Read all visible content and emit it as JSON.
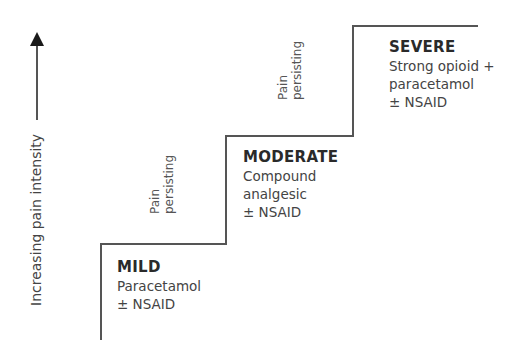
{
  "axis": {
    "label": "Increasing pain intensity",
    "arrow": "arrow-up"
  },
  "steps": [
    {
      "title": "MILD",
      "lines": [
        "Paracetamol",
        "± NSAID"
      ]
    },
    {
      "title": "MODERATE",
      "lines": [
        "Compound",
        "analgesic",
        "± NSAID"
      ]
    },
    {
      "title": "SEVERE",
      "lines": [
        "Strong opioid +",
        "paracetamol",
        "± NSAID"
      ]
    }
  ],
  "transitions": [
    {
      "line1": "Pain",
      "line2": "persisting"
    },
    {
      "line1": "Pain",
      "line2": "persisting"
    }
  ],
  "colors": {
    "line": "#555555",
    "text": "#444444"
  }
}
